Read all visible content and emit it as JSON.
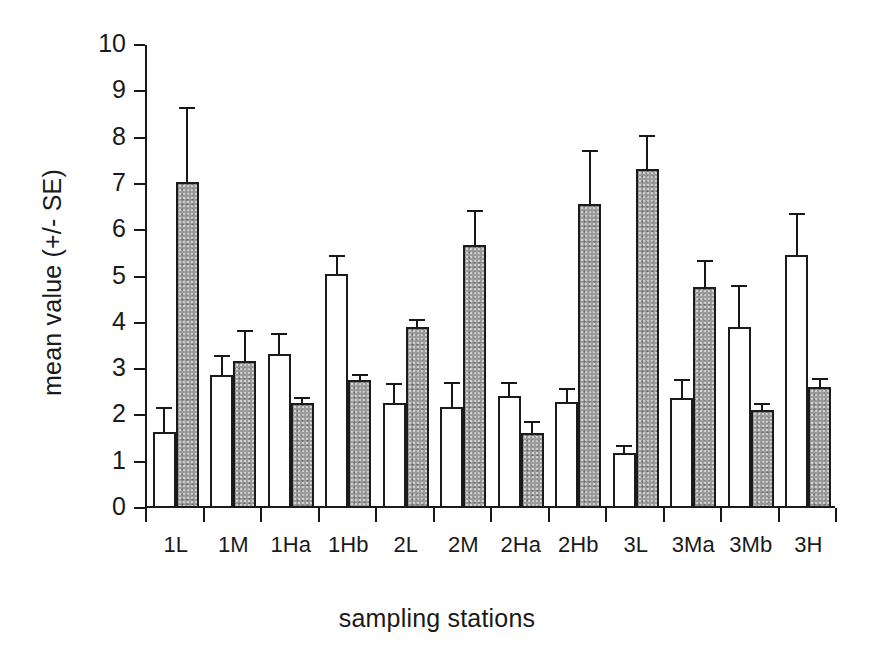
{
  "chart_data": {
    "type": "bar",
    "title": "",
    "xlabel": "sampling stations",
    "ylabel": "mean value (+/- SE)",
    "ylim": [
      0,
      10
    ],
    "ytick_labels": [
      "0",
      "1",
      "2",
      "3",
      "4",
      "5",
      "6",
      "7",
      "8",
      "9",
      "10"
    ],
    "yticks": [
      0,
      1,
      2,
      3,
      4,
      5,
      6,
      7,
      8,
      9,
      10
    ],
    "grid": false,
    "legend": "none",
    "error_bars": "SE (upper only)",
    "categories": [
      "1L",
      "1M",
      "1Ha",
      "1Hb",
      "2L",
      "2M",
      "2Ha",
      "2Hb",
      "3L",
      "3Ma",
      "3Mb",
      "3H"
    ],
    "series": [
      {
        "name": "open",
        "fill": "white",
        "values": [
          1.65,
          2.87,
          3.33,
          5.05,
          2.27,
          2.18,
          2.42,
          2.3,
          1.18,
          2.37,
          3.92,
          5.47
        ],
        "errors": [
          0.5,
          0.42,
          0.43,
          0.4,
          0.4,
          0.53,
          0.27,
          0.27,
          0.16,
          0.4,
          0.87,
          0.88
        ]
      },
      {
        "name": "filled",
        "fill": "gray",
        "values": [
          7.05,
          3.17,
          2.27,
          2.77,
          3.92,
          5.67,
          1.63,
          6.57,
          7.33,
          4.78,
          2.12,
          2.62
        ],
        "errors": [
          1.58,
          0.65,
          0.1,
          0.11,
          0.15,
          0.75,
          0.22,
          1.15,
          0.7,
          0.55,
          0.13,
          0.17
        ]
      }
    ]
  },
  "colors": {
    "fill_gray": "#9b9b9b",
    "open_white": "#ffffff",
    "ink": "#181818",
    "background": "#ffffff"
  }
}
